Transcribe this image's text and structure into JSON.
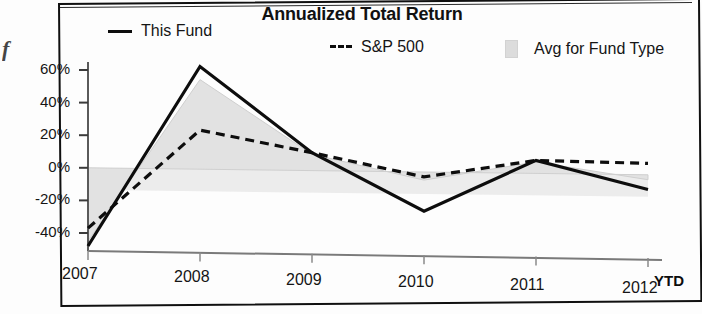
{
  "scan": {
    "edge_artifact": "f"
  },
  "chart_data": {
    "type": "line",
    "title": "Annualized Total Return",
    "xlabel": "",
    "ylabel": "",
    "x_axis_note": "YTD",
    "categories": [
      "2007",
      "2008",
      "2009",
      "2010",
      "2011",
      "2012"
    ],
    "ytick_labels": [
      "60%",
      "40%",
      "20%",
      "0%",
      "-20%",
      "-40%"
    ],
    "ytick_values": [
      60,
      40,
      20,
      0,
      -20,
      -40
    ],
    "ylim": [
      -52,
      68
    ],
    "grid": false,
    "legend_position": "top",
    "series": [
      {
        "name": "This Fund",
        "style": "solid-line",
        "color": "#0d0d0d",
        "values": [
          -48,
          63,
          11,
          -24,
          8,
          -9
        ]
      },
      {
        "name": "S&P 500",
        "style": "dashed-line",
        "color": "#0d0d0d",
        "values": [
          -37,
          24,
          11,
          -3,
          8,
          7
        ]
      },
      {
        "name": "Avg for Fund Type",
        "style": "filled-area",
        "color": "#dcdcdc",
        "values": [
          -45,
          55,
          10,
          -5,
          7,
          -3
        ]
      }
    ]
  }
}
